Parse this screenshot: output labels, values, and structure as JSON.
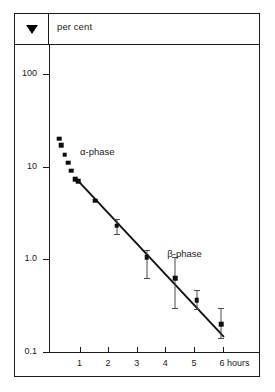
{
  "header": {
    "marker_icon": "down-triangle-icon",
    "unit_label": "per cent"
  },
  "annotations": {
    "alpha": "α-phase",
    "beta": "β-phase"
  },
  "chart_data": {
    "type": "scatter",
    "title": "",
    "subtitle": "",
    "xlabel": "hours",
    "ylabel": "per cent",
    "yscale": "log",
    "xscale": "linear",
    "xlim": [
      0,
      6.6
    ],
    "ylim": [
      0.1,
      200
    ],
    "grid": false,
    "legend": "none",
    "ytick_labels": [
      "100",
      "10",
      "1.0",
      "0.1"
    ],
    "ytick_values": [
      100,
      10,
      1.0,
      0.1
    ],
    "xtick_labels": [
      "1",
      "2",
      "3",
      "4",
      "5",
      "6 hours"
    ],
    "xtick_values": [
      1,
      2,
      3,
      4,
      5,
      6
    ],
    "axis_unit_suffix": "hours",
    "series": [
      {
        "name": "α-phase",
        "marker": "square",
        "x": [
          0.3,
          0.36,
          0.48,
          0.6,
          0.72,
          0.86
        ],
        "values": [
          20.0,
          17.0,
          13.5,
          11.0,
          9.0,
          7.3
        ],
        "errors": [
          null,
          null,
          null,
          null,
          null,
          null
        ]
      },
      {
        "name": "β-phase",
        "marker": "square",
        "x": [
          0.95,
          1.55,
          2.3,
          3.35,
          4.35,
          5.1,
          5.95
        ],
        "values": [
          7.0,
          4.3,
          2.3,
          1.05,
          0.62,
          0.36,
          0.2
        ],
        "errors": [
          null,
          null,
          {
            "low": 1.85,
            "high": 2.75
          },
          {
            "low": 0.62,
            "high": 1.25
          },
          {
            "low": 0.3,
            "high": 1.05
          },
          {
            "low": 0.29,
            "high": 0.46
          },
          {
            "low": 0.14,
            "high": 0.3
          }
        ]
      }
    ],
    "fit_line": {
      "name": "β-phase fit",
      "x": [
        0.92,
        6.05
      ],
      "values": [
        7.2,
        0.145
      ]
    }
  }
}
